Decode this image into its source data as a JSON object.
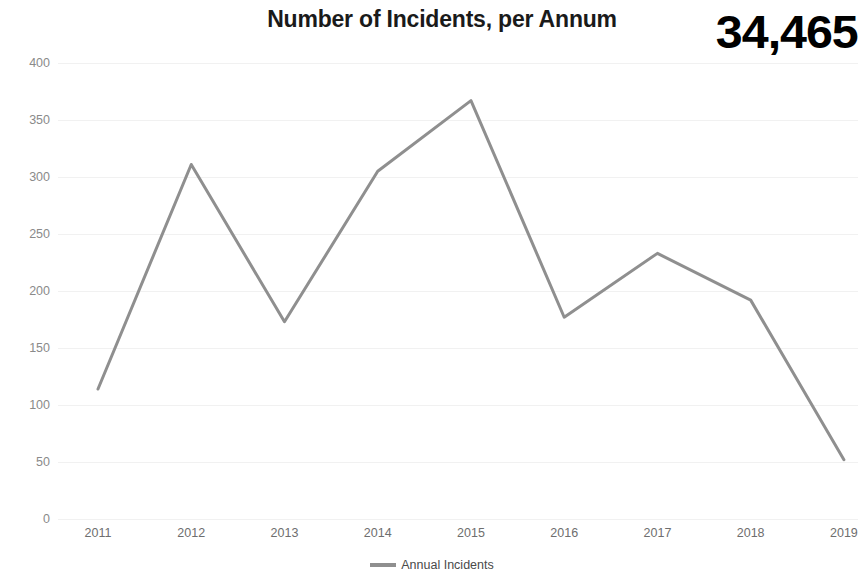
{
  "header": {
    "title": "Number of Incidents, per Annum",
    "kpi_value": "34,465"
  },
  "legend": {
    "position": "bottom-center",
    "entries": [
      {
        "label": "Annual Incidents",
        "color": "#8f8f8f",
        "icon": "line-swatch-icon"
      }
    ]
  },
  "axes": {
    "y_tick_labels": [
      "400",
      "350",
      "300",
      "250",
      "200",
      "150",
      "100",
      "50",
      "0"
    ],
    "x_tick_labels": [
      "2011",
      "2012",
      "2013",
      "2014",
      "2015",
      "2016",
      "2017",
      "2018",
      "2019"
    ]
  },
  "chart_data": {
    "type": "line",
    "title": "Number of Incidents, per Annum",
    "xlabel": "",
    "ylabel": "",
    "categories": [
      "2011",
      "2012",
      "2013",
      "2014",
      "2015",
      "2016",
      "2017",
      "2018",
      "2019"
    ],
    "series": [
      {
        "name": "Annual Incidents",
        "color": "#8f8f8f",
        "values": [
          114,
          311,
          173,
          305,
          367,
          177,
          233,
          192,
          52
        ]
      }
    ],
    "ylim": [
      0,
      400
    ],
    "yticks": [
      0,
      50,
      100,
      150,
      200,
      250,
      300,
      350,
      400
    ],
    "grid": true,
    "markers": false,
    "legend_position": "bottom-center",
    "annotations": [
      {
        "text": "34,465",
        "role": "kpi-total"
      }
    ]
  },
  "style": {
    "background": "#ffffff",
    "line_color": "#8f8f8f",
    "gridline_color": "#f1f1f1",
    "axis_label_color": "#8a8a8a",
    "title_color": "#1a1a1a",
    "kpi_color": "#000000"
  }
}
